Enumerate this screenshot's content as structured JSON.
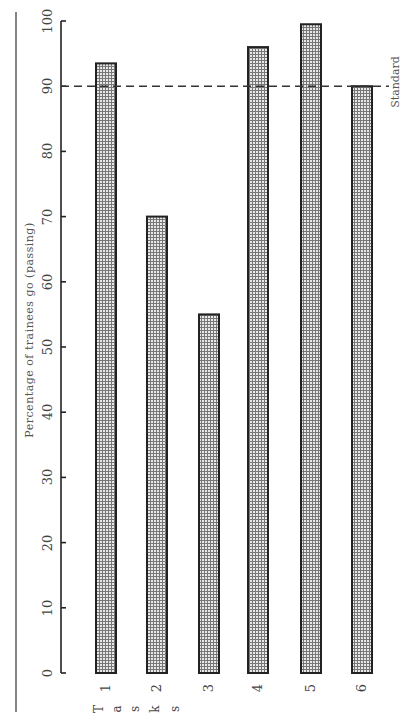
{
  "chart_data": {
    "type": "bar",
    "orientation": "vertical (page rotated 90°)",
    "title": "",
    "xlabel": "Tasks",
    "ylabel": "Percentage of trainees go (passing)",
    "categories": [
      "1",
      "2",
      "3",
      "4",
      "5",
      "6"
    ],
    "values": [
      93.5,
      70,
      55,
      96,
      99.5,
      90
    ],
    "ylim": [
      0,
      100
    ],
    "yticks": [
      0,
      10,
      20,
      30,
      40,
      50,
      60,
      70,
      80,
      90,
      100
    ],
    "grid": false,
    "legend": null,
    "reference_line": {
      "value": 90,
      "label": "Standard",
      "style": "dashed"
    },
    "bar_fill": "dotted-grid pattern",
    "bar_edge_color": "#222222"
  },
  "labels": {
    "ylabel": "Percentage of trainees go (passing)",
    "xlabel_letters": [
      "T",
      "a",
      "s",
      "k",
      "s"
    ],
    "standard": "Standard"
  }
}
